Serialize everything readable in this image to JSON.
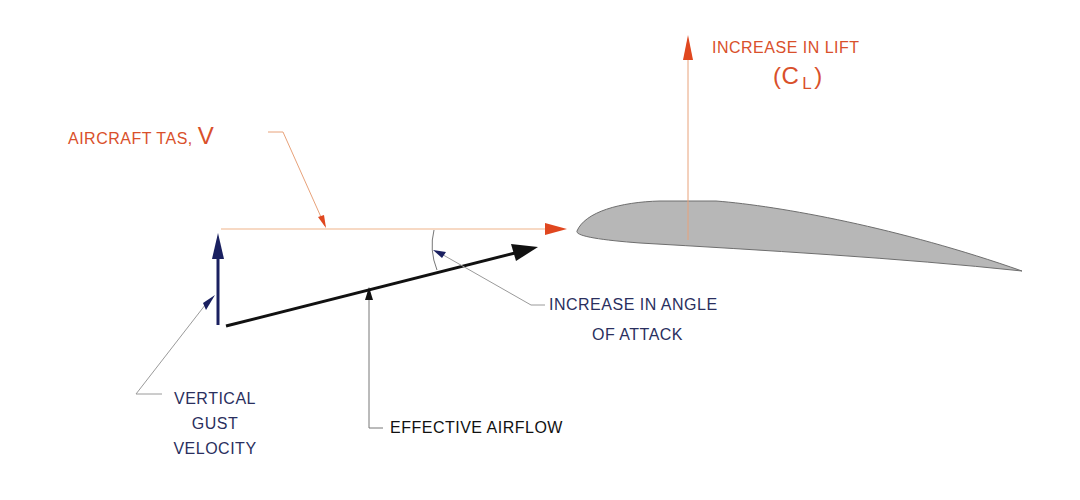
{
  "diagram": {
    "labels": {
      "lift_line1": "INCREASE IN LIFT",
      "lift_open": "(",
      "lift_c": "C",
      "lift_sub": "L",
      "lift_close": ")",
      "tas_text": "AIRCRAFT TAS, ",
      "tas_symbol": "V",
      "aoa_line1": "INCREASE IN ANGLE",
      "aoa_line2": "OF ATTACK",
      "gust_line1": "VERTICAL",
      "gust_line2": "GUST",
      "gust_line3": "VELOCITY",
      "effective_airflow": "EFFECTIVE AIRFLOW"
    },
    "colors": {
      "orange": "#d9502b",
      "orange_line": "#f0b48a",
      "navy": "#1a2060",
      "black": "#111111",
      "airfoil_fill": "#b7b7b7",
      "airfoil_stroke": "#6e6e6e",
      "leader_gray": "#9a9a9a"
    }
  }
}
